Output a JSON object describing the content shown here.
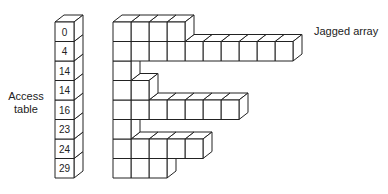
{
  "labels": {
    "access_table": [
      "Access",
      "table"
    ],
    "jagged_array": "Jagged array"
  },
  "access_table": [
    0,
    4,
    14,
    14,
    16,
    23,
    24,
    29
  ],
  "row_lengths": [
    4,
    10,
    0,
    2,
    7,
    1,
    5,
    3
  ],
  "geometry": {
    "table_x": 55,
    "table_w": 19,
    "top_y": 22,
    "cell_h": 19.5,
    "array_x": 113,
    "cell_w": 18,
    "depth_dx": 9,
    "depth_dy": 7
  },
  "colors": {
    "stroke": "#222222",
    "fill": "#ffffff",
    "text": "#222222"
  }
}
